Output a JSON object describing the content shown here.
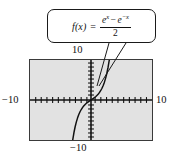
{
  "figure": {
    "kind": "graphing-calculator-plot",
    "background_color": "#ffffff",
    "plot_background_color": "#e2e2e2",
    "frame_color": "#3a3a3a",
    "curve_color": "#111111"
  },
  "callout": {
    "label": "function-formula",
    "lhs": "f(x)",
    "equals": "=",
    "numerator_first_term": "e",
    "numerator_first_exp": "x",
    "numerator_operator": "−",
    "numerator_second_term": "e",
    "numerator_second_exp": "−x",
    "denominator": "2",
    "plain_text": "f(x) = (e^x − e^−x) / 2",
    "border_color": "#1a1a1a",
    "fill_color": "#ffffff"
  },
  "axis_labels": {
    "top": "10",
    "bottom": "−10",
    "left": "−10",
    "right": "10"
  },
  "chart_data": {
    "type": "line",
    "title": "",
    "subtitle": "",
    "xlabel": "",
    "ylabel": "",
    "xlim": [
      -10,
      10
    ],
    "ylim": [
      -10,
      10
    ],
    "grid": false,
    "legend": null,
    "tick_spacing_x": 1,
    "tick_spacing_y": 1,
    "annotations": [
      {
        "text": "f(x) = (e^x − e^−x) / 2",
        "kind": "callout-box",
        "points_to": "curve"
      }
    ],
    "series": [
      {
        "name": "f(x) = (e^x - e^-x)/2",
        "equation": "sinh(x)",
        "x": [
          -3.0,
          -2.8,
          -2.6,
          -2.4,
          -2.2,
          -2.0,
          -1.8,
          -1.6,
          -1.4,
          -1.2,
          -1.0,
          -0.8,
          -0.6,
          -0.4,
          -0.2,
          0.0,
          0.2,
          0.4,
          0.6,
          0.8,
          1.0,
          1.2,
          1.4,
          1.6,
          1.8,
          2.0,
          2.2,
          2.4,
          2.6,
          2.8,
          3.0
        ],
        "y": [
          -10.02,
          -8.19,
          -6.69,
          -5.47,
          -4.46,
          -3.63,
          -2.94,
          -2.38,
          -1.9,
          -1.51,
          -1.18,
          -0.89,
          -0.64,
          -0.41,
          -0.2,
          0.0,
          0.2,
          0.41,
          0.64,
          0.89,
          1.18,
          1.51,
          1.9,
          2.38,
          2.94,
          3.63,
          4.46,
          5.47,
          6.69,
          8.19,
          10.02
        ]
      }
    ]
  }
}
